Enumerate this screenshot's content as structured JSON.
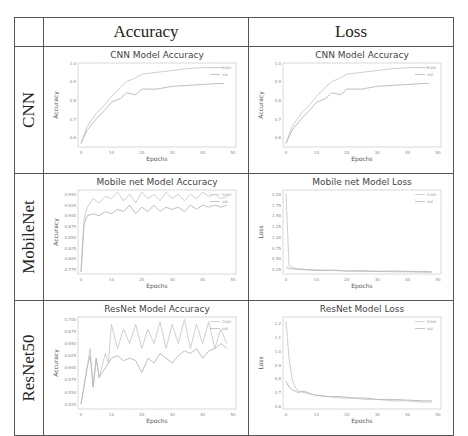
{
  "table": {
    "col_headers": [
      "Accuracy",
      "Loss"
    ],
    "row_labels": [
      "CNN",
      "MobileNet",
      "ResNet50"
    ]
  },
  "chart_data": [
    {
      "type": "line",
      "title": "CNN Model Accuracy",
      "xlabel": "Epochs",
      "ylabel": "Accuracy",
      "xlim": [
        0,
        50
      ],
      "ylim": [
        0.55,
        1.0
      ],
      "xticks": [
        "0",
        "10",
        "20",
        "30",
        "40",
        "50"
      ],
      "yticks": [
        "0.6",
        "0.7",
        "0.8",
        "0.9",
        "1.0"
      ],
      "legend": [
        "train",
        "val"
      ],
      "legend_position": "upper right",
      "grid": false,
      "x": [
        0,
        2,
        5,
        8,
        10,
        13,
        15,
        18,
        20,
        25,
        30,
        35,
        40,
        45,
        47
      ],
      "series": [
        {
          "name": "train",
          "values": [
            0.57,
            0.66,
            0.73,
            0.78,
            0.82,
            0.87,
            0.9,
            0.92,
            0.94,
            0.95,
            0.96,
            0.97,
            0.975,
            0.975,
            0.975
          ]
        },
        {
          "name": "val",
          "values": [
            0.57,
            0.64,
            0.7,
            0.75,
            0.79,
            0.81,
            0.84,
            0.83,
            0.86,
            0.86,
            0.875,
            0.88,
            0.885,
            0.89,
            0.89
          ]
        }
      ]
    },
    {
      "type": "line",
      "title": "CNN Model Accuracy",
      "xlabel": "Epochs",
      "ylabel": "Accuracy",
      "xlim": [
        0,
        50
      ],
      "ylim": [
        0.55,
        1.0
      ],
      "xticks": [
        "0",
        "10",
        "20",
        "30",
        "40",
        "50"
      ],
      "yticks": [
        "0.6",
        "0.7",
        "0.8",
        "0.9",
        "1.0"
      ],
      "legend": [
        "train",
        "val"
      ],
      "legend_position": "upper right",
      "grid": false,
      "x": [
        0,
        2,
        5,
        8,
        10,
        13,
        15,
        18,
        20,
        25,
        30,
        35,
        40,
        45,
        47
      ],
      "series": [
        {
          "name": "train",
          "values": [
            0.57,
            0.66,
            0.73,
            0.78,
            0.82,
            0.87,
            0.9,
            0.92,
            0.94,
            0.95,
            0.96,
            0.97,
            0.975,
            0.975,
            0.975
          ]
        },
        {
          "name": "val",
          "values": [
            0.57,
            0.64,
            0.7,
            0.75,
            0.79,
            0.81,
            0.84,
            0.83,
            0.86,
            0.86,
            0.875,
            0.88,
            0.885,
            0.89,
            0.89
          ]
        }
      ]
    },
    {
      "type": "line",
      "title": "Mobile net Model Accuracy",
      "xlabel": "Epochs",
      "ylabel": "Accuracy",
      "xlim": [
        0,
        50
      ],
      "ylim": [
        0.765,
        0.96
      ],
      "xticks": [
        "0",
        "10",
        "20",
        "30",
        "40",
        "50"
      ],
      "yticks": [
        "0.775",
        "0.800",
        "0.825",
        "0.850",
        "0.875",
        "0.900",
        "0.925",
        "0.950"
      ],
      "legend": [
        "train",
        "val"
      ],
      "legend_position": "upper right",
      "grid": false,
      "x": [
        0,
        1,
        2,
        4,
        6,
        8,
        10,
        12,
        14,
        16,
        18,
        20,
        22,
        24,
        26,
        28,
        30,
        32,
        34,
        36,
        38,
        40,
        42,
        44,
        46,
        48
      ],
      "series": [
        {
          "name": "train",
          "values": [
            0.77,
            0.89,
            0.92,
            0.94,
            0.93,
            0.945,
            0.94,
            0.955,
            0.935,
            0.95,
            0.93,
            0.955,
            0.94,
            0.95,
            0.935,
            0.955,
            0.94,
            0.95,
            0.935,
            0.95,
            0.94,
            0.955,
            0.945,
            0.95,
            0.94,
            0.945
          ]
        },
        {
          "name": "val",
          "values": [
            0.77,
            0.88,
            0.9,
            0.905,
            0.9,
            0.91,
            0.905,
            0.915,
            0.91,
            0.925,
            0.905,
            0.92,
            0.91,
            0.925,
            0.91,
            0.92,
            0.915,
            0.92,
            0.91,
            0.925,
            0.915,
            0.925,
            0.92,
            0.925,
            0.92,
            0.925
          ]
        }
      ]
    },
    {
      "type": "line",
      "title": "Mobile net Model Loss",
      "xlabel": "Epochs",
      "ylabel": "Loss",
      "xlim": [
        0,
        50
      ],
      "ylim": [
        0.15,
        2.1
      ],
      "xticks": [
        "0",
        "10",
        "20",
        "30",
        "40",
        "50"
      ],
      "yticks": [
        "0.25",
        "0.50",
        "0.75",
        "1.00",
        "1.25",
        "1.50",
        "1.75",
        "2.00"
      ],
      "legend": [
        "train",
        "val"
      ],
      "legend_position": "upper right",
      "grid": false,
      "x": [
        0,
        1,
        2,
        4,
        8,
        12,
        16,
        20,
        25,
        30,
        35,
        40,
        45,
        48
      ],
      "series": [
        {
          "name": "train",
          "values": [
            2.02,
            0.35,
            0.3,
            0.27,
            0.25,
            0.24,
            0.23,
            0.22,
            0.21,
            0.21,
            0.2,
            0.2,
            0.19,
            0.19
          ]
        },
        {
          "name": "val",
          "values": [
            0.3,
            0.28,
            0.27,
            0.26,
            0.24,
            0.23,
            0.24,
            0.22,
            0.23,
            0.21,
            0.22,
            0.21,
            0.21,
            0.2
          ]
        }
      ]
    },
    {
      "type": "line",
      "title": "ResNet Model Accuracy",
      "xlabel": "Epochs",
      "ylabel": "Accuracy",
      "xlim": [
        0,
        50
      ],
      "ylim": [
        0.515,
        0.705
      ],
      "xticks": [
        "0",
        "10",
        "20",
        "30",
        "40",
        "50"
      ],
      "yticks": [
        "0.525",
        "0.550",
        "0.575",
        "0.600",
        "0.625",
        "0.650",
        "0.675",
        "0.700"
      ],
      "legend": [
        "train",
        "val"
      ],
      "legend_position": "upper right",
      "grid": false,
      "x": [
        0,
        2,
        3,
        4,
        5,
        6,
        8,
        9,
        10,
        12,
        14,
        16,
        18,
        20,
        22,
        24,
        26,
        28,
        30,
        32,
        34,
        36,
        38,
        40,
        42,
        44,
        46,
        48
      ],
      "series": [
        {
          "name": "train",
          "values": [
            0.525,
            0.6,
            0.64,
            0.56,
            0.62,
            0.58,
            0.63,
            0.61,
            0.69,
            0.64,
            0.68,
            0.65,
            0.69,
            0.64,
            0.68,
            0.65,
            0.695,
            0.64,
            0.69,
            0.65,
            0.7,
            0.64,
            0.69,
            0.65,
            0.695,
            0.64,
            0.68,
            0.65
          ]
        },
        {
          "name": "val",
          "values": [
            0.525,
            0.6,
            0.625,
            0.56,
            0.62,
            0.58,
            0.6,
            0.61,
            0.62,
            0.625,
            0.615,
            0.62,
            0.615,
            0.59,
            0.62,
            0.61,
            0.63,
            0.62,
            0.61,
            0.625,
            0.635,
            0.63,
            0.64,
            0.62,
            0.635,
            0.64,
            0.65,
            0.64
          ]
        }
      ]
    },
    {
      "type": "line",
      "title": "ResNet Model Loss",
      "xlabel": "Epochs",
      "ylabel": "Loss",
      "xlim": [
        0,
        50
      ],
      "ylim": [
        0.58,
        1.25
      ],
      "xticks": [
        "0",
        "10",
        "20",
        "30",
        "40",
        "50"
      ],
      "yticks": [
        "0.6",
        "0.7",
        "0.8",
        "0.9",
        "1.0",
        "1.1",
        "1.2"
      ],
      "legend": [
        "train",
        "val"
      ],
      "legend_position": "upper right",
      "grid": false,
      "x": [
        0,
        1,
        2,
        3,
        4,
        6,
        8,
        10,
        14,
        18,
        22,
        26,
        30,
        35,
        40,
        45,
        48
      ],
      "series": [
        {
          "name": "train",
          "values": [
            1.22,
            0.95,
            0.8,
            0.74,
            0.71,
            0.7,
            0.69,
            0.68,
            0.67,
            0.66,
            0.66,
            0.65,
            0.65,
            0.64,
            0.64,
            0.63,
            0.63
          ]
        },
        {
          "name": "val",
          "values": [
            0.78,
            0.74,
            0.72,
            0.71,
            0.7,
            0.71,
            0.69,
            0.68,
            0.67,
            0.67,
            0.66,
            0.66,
            0.65,
            0.65,
            0.645,
            0.64,
            0.64
          ]
        }
      ]
    }
  ]
}
